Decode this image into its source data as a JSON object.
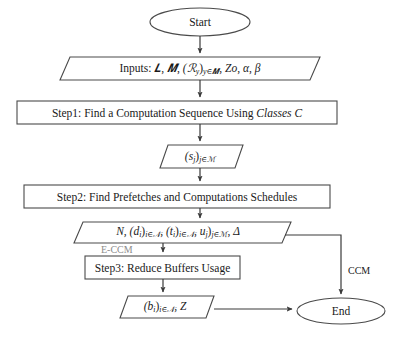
{
  "diagram": {
    "type": "flowchart",
    "stroke_color": "#444444",
    "text_color": "#1a1a1a",
    "muted_color": "#8c8c8c",
    "background": "#ffffff"
  },
  "nodes": {
    "start": {
      "shape": "ellipse",
      "label": "Start"
    },
    "inputs": {
      "shape": "parallelogram",
      "label": "Inputs: ᵍ\u0001",
      "label_plain": "Inputs: ᵋ, ᵎ, (ℛᵧ)ᵧ∈ᵎ, Zo, α, β",
      "parts": {
        "prefix": "Inputs:",
        "x_set": "𝑳",
        "y_set": "𝑴",
        "r_family": "(ℛ",
        "r_sub": "y",
        "r_close": ")",
        "r_index": "y∈",
        "zo": "Zo",
        "alpha": "α",
        "beta": "β"
      }
    },
    "step1": {
      "shape": "rect",
      "label_prefix": "Step1: Find a Computation Sequence Using ",
      "label_italic": "Classes C"
    },
    "sj": {
      "shape": "parallelogram",
      "base": "(s",
      "sub1": "j",
      "close": ")",
      "sub2": "j∈",
      "set": "ℳ"
    },
    "step2": {
      "shape": "rect",
      "label": "Step2: Find Prefetches and Computations Schedules"
    },
    "outputs2": {
      "shape": "parallelogram",
      "n": "N,",
      "d_base": "(d",
      "d_sub": "i",
      "d_close": ")",
      "d_idx": "i∈",
      "d_set": "𝒩",
      "t_base": "(t",
      "t_sub": "i",
      "t_close": ")",
      "t_idx": "i∈",
      "t_set": "𝒩",
      "u_base": "u",
      "u_sub": "j",
      "u_close": ")",
      "u_idx": "j∈",
      "u_set": "ℳ",
      "delta": "Δ",
      "comma": ","
    },
    "step3": {
      "shape": "rect",
      "label": "Step3: Reduce Buffers Usage"
    },
    "outputs3": {
      "shape": "parallelogram",
      "b_base": "(b",
      "b_sub": "i",
      "b_close": ")",
      "b_idx": "i∈",
      "b_set": "𝒩",
      "tail": ", Z"
    },
    "end": {
      "shape": "ellipse",
      "label": "End"
    }
  },
  "edge_labels": {
    "e_ccm": "E-CCM",
    "ccm": "CCM"
  }
}
